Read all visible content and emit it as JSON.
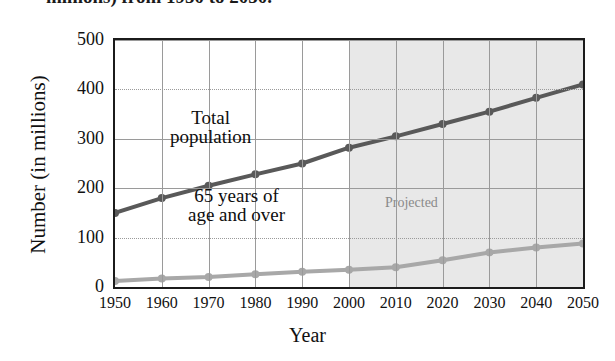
{
  "title_partial": "millions) from 1950 to 2050.",
  "axes": {
    "ylabel": "Number (in millions)",
    "xlabel": "Year",
    "yticks": [
      "500",
      "400",
      "300",
      "200",
      "100",
      "0"
    ],
    "xticks": [
      "1950",
      "1960",
      "1970",
      "1980",
      "1990",
      "2000",
      "2010",
      "2020",
      "2030",
      "2040",
      "2050"
    ]
  },
  "annotations": {
    "total_line1": "Total",
    "total_line2": "population",
    "elderly_line1": "65 years of",
    "elderly_line2": "age and over",
    "projected": "Projected"
  },
  "colors": {
    "total_series": "#595959",
    "elderly_series": "#a8a8a8",
    "projected_band": "#e8e8e8",
    "grid": "#9a9a9a",
    "frame": "#1b1b1b",
    "projected_text": "#8a8a8a"
  },
  "chart_data": {
    "type": "line",
    "xlabel": "Year",
    "ylabel": "Number (in millions)",
    "x": [
      1950,
      1960,
      1970,
      1980,
      1990,
      2000,
      2010,
      2020,
      2030,
      2040,
      2050
    ],
    "xlim": [
      1950,
      2050
    ],
    "ylim": [
      0,
      500
    ],
    "ytick_values": [
      0,
      100,
      200,
      300,
      400,
      500
    ],
    "grid": true,
    "legend": "none",
    "series": [
      {
        "name": "Total population",
        "color": "#595959",
        "values": [
          150,
          180,
          205,
          228,
          250,
          282,
          305,
          330,
          355,
          383,
          410
        ]
      },
      {
        "name": "65 years of age and over",
        "color": "#a8a8a8",
        "values": [
          12,
          17,
          20,
          26,
          31,
          35,
          40,
          54,
          70,
          80,
          88
        ]
      }
    ],
    "shaded_region": {
      "label": "Projected",
      "x_start": 2000,
      "x_end": 2050,
      "color": "#e8e8e8"
    }
  }
}
